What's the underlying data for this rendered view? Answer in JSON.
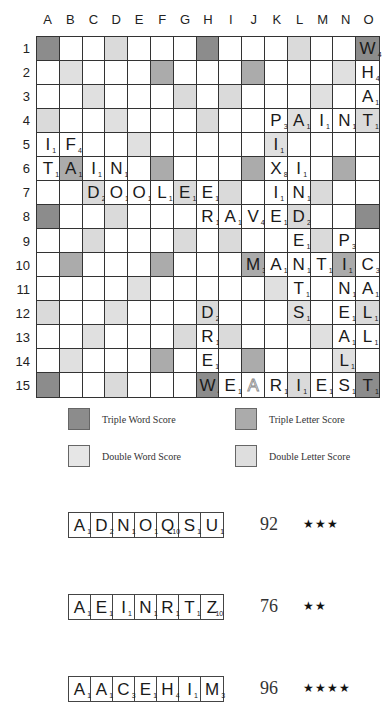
{
  "board": {
    "columns": [
      "A",
      "B",
      "C",
      "D",
      "E",
      "F",
      "G",
      "H",
      "I",
      "J",
      "K",
      "L",
      "M",
      "N",
      "O"
    ],
    "rows": [
      "1",
      "2",
      "3",
      "4",
      "5",
      "6",
      "7",
      "8",
      "9",
      "10",
      "11",
      "12",
      "13",
      "14",
      "15"
    ],
    "premium_layout": [
      [
        "TW",
        "N",
        "N",
        "DL",
        "N",
        "N",
        "N",
        "TW",
        "N",
        "N",
        "N",
        "DL",
        "N",
        "N",
        "TW"
      ],
      [
        "N",
        "DW",
        "N",
        "N",
        "N",
        "TL",
        "N",
        "N",
        "N",
        "TL",
        "N",
        "N",
        "N",
        "DW",
        "N"
      ],
      [
        "N",
        "N",
        "DW",
        "N",
        "N",
        "N",
        "DL",
        "N",
        "DL",
        "N",
        "N",
        "N",
        "DW",
        "N",
        "N"
      ],
      [
        "DL",
        "N",
        "N",
        "DW",
        "N",
        "N",
        "N",
        "DL",
        "N",
        "N",
        "N",
        "DW",
        "N",
        "N",
        "DL"
      ],
      [
        "N",
        "N",
        "N",
        "N",
        "DW",
        "N",
        "N",
        "N",
        "N",
        "N",
        "DW",
        "N",
        "N",
        "N",
        "N"
      ],
      [
        "N",
        "TL",
        "N",
        "N",
        "N",
        "TL",
        "N",
        "N",
        "N",
        "TL",
        "N",
        "N",
        "N",
        "TL",
        "N"
      ],
      [
        "N",
        "N",
        "DL",
        "N",
        "N",
        "N",
        "DL",
        "N",
        "DL",
        "N",
        "N",
        "N",
        "DL",
        "N",
        "N"
      ],
      [
        "TW",
        "N",
        "N",
        "DL",
        "N",
        "N",
        "N",
        "N",
        "N",
        "N",
        "N",
        "DL",
        "N",
        "N",
        "TW"
      ],
      [
        "N",
        "N",
        "DL",
        "N",
        "N",
        "N",
        "DL",
        "N",
        "DL",
        "N",
        "N",
        "N",
        "DL",
        "N",
        "N"
      ],
      [
        "N",
        "TL",
        "N",
        "N",
        "N",
        "TL",
        "N",
        "N",
        "N",
        "TL",
        "N",
        "N",
        "N",
        "TL",
        "N"
      ],
      [
        "N",
        "N",
        "N",
        "N",
        "DW",
        "N",
        "N",
        "N",
        "N",
        "N",
        "DW",
        "N",
        "N",
        "N",
        "N"
      ],
      [
        "DL",
        "N",
        "N",
        "DW",
        "N",
        "N",
        "N",
        "DL",
        "N",
        "N",
        "N",
        "DW",
        "N",
        "N",
        "DL"
      ],
      [
        "N",
        "N",
        "DW",
        "N",
        "N",
        "N",
        "DL",
        "N",
        "DL",
        "N",
        "N",
        "N",
        "DW",
        "N",
        "N"
      ],
      [
        "N",
        "DW",
        "N",
        "N",
        "N",
        "TL",
        "N",
        "N",
        "N",
        "TL",
        "N",
        "N",
        "N",
        "DW",
        "N"
      ],
      [
        "TW",
        "N",
        "N",
        "DL",
        "N",
        "N",
        "N",
        "TW",
        "N",
        "N",
        "N",
        "DL",
        "N",
        "N",
        "TW"
      ]
    ],
    "tiles": [
      {
        "cell": "O1",
        "letter": "W",
        "value": "4"
      },
      {
        "cell": "O2",
        "letter": "H",
        "value": "4"
      },
      {
        "cell": "O3",
        "letter": "A",
        "value": "1"
      },
      {
        "cell": "K4",
        "letter": "P",
        "value": "3"
      },
      {
        "cell": "L4",
        "letter": "A",
        "value": "1"
      },
      {
        "cell": "M4",
        "letter": "I",
        "value": "1"
      },
      {
        "cell": "N4",
        "letter": "N",
        "value": "1"
      },
      {
        "cell": "O4",
        "letter": "T",
        "value": "1"
      },
      {
        "cell": "A5",
        "letter": "I",
        "value": "1"
      },
      {
        "cell": "B5",
        "letter": "F",
        "value": "4"
      },
      {
        "cell": "K5",
        "letter": "I",
        "value": "1"
      },
      {
        "cell": "A6",
        "letter": "T",
        "value": "1"
      },
      {
        "cell": "B6",
        "letter": "A",
        "value": "1"
      },
      {
        "cell": "C6",
        "letter": "I",
        "value": "1"
      },
      {
        "cell": "D6",
        "letter": "N",
        "value": "1"
      },
      {
        "cell": "K6",
        "letter": "X",
        "value": "8"
      },
      {
        "cell": "L6",
        "letter": "I",
        "value": "1"
      },
      {
        "cell": "C7",
        "letter": "D",
        "value": "2"
      },
      {
        "cell": "D7",
        "letter": "O",
        "value": "1"
      },
      {
        "cell": "E7",
        "letter": "O",
        "value": "1"
      },
      {
        "cell": "F7",
        "letter": "L",
        "value": "1"
      },
      {
        "cell": "G7",
        "letter": "E",
        "value": "1"
      },
      {
        "cell": "H7",
        "letter": "E",
        "value": "1"
      },
      {
        "cell": "K7",
        "letter": "I",
        "value": "1"
      },
      {
        "cell": "L7",
        "letter": "N",
        "value": "1"
      },
      {
        "cell": "H8",
        "letter": "R",
        "value": "1"
      },
      {
        "cell": "I8",
        "letter": "A",
        "value": "1"
      },
      {
        "cell": "J8",
        "letter": "V",
        "value": "4"
      },
      {
        "cell": "K8",
        "letter": "E",
        "value": "1"
      },
      {
        "cell": "L8",
        "letter": "D",
        "value": "2"
      },
      {
        "cell": "L9",
        "letter": "E",
        "value": "1"
      },
      {
        "cell": "N9",
        "letter": "P",
        "value": "3"
      },
      {
        "cell": "J10",
        "letter": "M",
        "value": "3"
      },
      {
        "cell": "K10",
        "letter": "A",
        "value": "1"
      },
      {
        "cell": "L10",
        "letter": "N",
        "value": "1"
      },
      {
        "cell": "M10",
        "letter": "T",
        "value": "1"
      },
      {
        "cell": "N10",
        "letter": "I",
        "value": "1"
      },
      {
        "cell": "O10",
        "letter": "C",
        "value": "3"
      },
      {
        "cell": "L11",
        "letter": "T",
        "value": "1"
      },
      {
        "cell": "N11",
        "letter": "N",
        "value": "1"
      },
      {
        "cell": "O11",
        "letter": "A",
        "value": "1"
      },
      {
        "cell": "H12",
        "letter": "D",
        "value": "2"
      },
      {
        "cell": "L12",
        "letter": "S",
        "value": "1"
      },
      {
        "cell": "N12",
        "letter": "E",
        "value": "1"
      },
      {
        "cell": "O12",
        "letter": "L",
        "value": "1"
      },
      {
        "cell": "H13",
        "letter": "R",
        "value": "1"
      },
      {
        "cell": "N13",
        "letter": "A",
        "value": "1"
      },
      {
        "cell": "O13",
        "letter": "L",
        "value": "1"
      },
      {
        "cell": "H14",
        "letter": "E",
        "value": "1"
      },
      {
        "cell": "N14",
        "letter": "L",
        "value": "1"
      },
      {
        "cell": "H15",
        "letter": "W",
        "value": "4"
      },
      {
        "cell": "I15",
        "letter": "E",
        "value": "1"
      },
      {
        "cell": "J15",
        "letter": "A",
        "value": "",
        "blank": true
      },
      {
        "cell": "K15",
        "letter": "R",
        "value": "1"
      },
      {
        "cell": "L15",
        "letter": "I",
        "value": "1"
      },
      {
        "cell": "M15",
        "letter": "E",
        "value": "1"
      },
      {
        "cell": "N15",
        "letter": "S",
        "value": "1"
      },
      {
        "cell": "O15",
        "letter": "T",
        "value": "1"
      }
    ]
  },
  "legend": [
    {
      "key": "TW",
      "label": "Triple Word Score",
      "color": "#8c8c8c"
    },
    {
      "key": "TL",
      "label": "Triple Letter Score",
      "color": "#ababab"
    },
    {
      "key": "DW",
      "label": "Double Word Score",
      "color": "#e0e0e0"
    },
    {
      "key": "DL",
      "label": "Double Letter Score",
      "color": "#dadada"
    }
  ],
  "racks": [
    {
      "tiles": [
        {
          "letter": "A",
          "value": "1"
        },
        {
          "letter": "D",
          "value": "2"
        },
        {
          "letter": "N",
          "value": "1"
        },
        {
          "letter": "O",
          "value": "1"
        },
        {
          "letter": "Q",
          "value": "10"
        },
        {
          "letter": "S",
          "value": "1"
        },
        {
          "letter": "U",
          "value": "1"
        }
      ],
      "score": "92",
      "stars": "★★★"
    },
    {
      "tiles": [
        {
          "letter": "A",
          "value": "1"
        },
        {
          "letter": "E",
          "value": "1"
        },
        {
          "letter": "I",
          "value": "1"
        },
        {
          "letter": "N",
          "value": "1"
        },
        {
          "letter": "R",
          "value": "1"
        },
        {
          "letter": "T",
          "value": "1"
        },
        {
          "letter": "Z",
          "value": "10"
        }
      ],
      "score": "76",
      "stars": "★★"
    },
    {
      "tiles": [
        {
          "letter": "A",
          "value": "1"
        },
        {
          "letter": "A",
          "value": "1"
        },
        {
          "letter": "C",
          "value": "3"
        },
        {
          "letter": "E",
          "value": "1"
        },
        {
          "letter": "H",
          "value": "4"
        },
        {
          "letter": "I",
          "value": "1"
        },
        {
          "letter": "M",
          "value": "3"
        }
      ],
      "score": "96",
      "stars": "★★★★"
    }
  ]
}
